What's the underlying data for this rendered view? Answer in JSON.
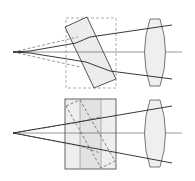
{
  "diagram": {
    "colors": {
      "background": "#ffffff",
      "line": "#3a3a3a",
      "dashed": "#777777",
      "fill_light": "#eeeeee",
      "fill_mid": "#e0e0e0",
      "frame_dashed": "#999999"
    },
    "panels": [
      {
        "id": "top",
        "element": "tilted-plate",
        "source_point": [
          13,
          52
        ],
        "axis_y": 52,
        "frame": {
          "x": 66,
          "y": 18,
          "w": 50,
          "h": 70,
          "style": "dashed"
        },
        "plate_polygon": [
          [
            65,
            27
          ],
          [
            87,
            17
          ],
          [
            116,
            79
          ],
          [
            94,
            88
          ]
        ],
        "lens": {
          "cx": 155,
          "cy": 52,
          "rx": 12,
          "ry": 34
        },
        "rays_solid": [
          [
            [
              13,
              52
            ],
            [
              30,
              52
            ],
            [
              76,
              42
            ],
            [
              90,
              36
            ],
            [
              172,
              24
            ]
          ],
          [
            [
              13,
              52
            ],
            [
              30,
              52
            ],
            [
              86,
              62
            ],
            [
              110,
              71
            ],
            [
              172,
              79
            ]
          ]
        ],
        "rays_dashed": [
          [
            [
              13,
              52
            ],
            [
              76,
              38
            ]
          ],
          [
            [
              13,
              52
            ],
            [
              76,
              66
            ]
          ]
        ]
      },
      {
        "id": "bottom",
        "element": "cube-assembly",
        "source_point": [
          13,
          133
        ],
        "axis_y": 133,
        "cube": {
          "x": 65,
          "y": 99,
          "w": 51,
          "h": 70
        },
        "cube_dividers_x": [
          80,
          101
        ],
        "inner_dashed_polygon": [
          [
            66,
            104
          ],
          [
            80,
            99
          ],
          [
            115,
            160
          ],
          [
            101,
            168
          ]
        ],
        "lens": {
          "cx": 155,
          "cy": 133,
          "rx": 12,
          "ry": 34
        },
        "rays_solid": [
          [
            [
              13,
              133
            ],
            [
              116,
              113
            ],
            [
              172,
              106
            ]
          ],
          [
            [
              13,
              133
            ],
            [
              116,
              160
            ],
            [
              172,
              162
            ]
          ]
        ],
        "rays_dashed": [
          [
            [
              13,
              133
            ],
            [
              80,
              122
            ],
            [
              116,
              113
            ]
          ],
          [
            [
              13,
              133
            ],
            [
              80,
              147
            ],
            [
              116,
              160
            ]
          ]
        ]
      }
    ]
  }
}
